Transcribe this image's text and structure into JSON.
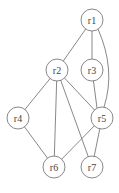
{
  "diagram": {
    "type": "graph",
    "nodes": [
      {
        "id": "r1",
        "label": "r1",
        "x": 92,
        "y": 20
      },
      {
        "id": "r2",
        "label": "r2",
        "x": 57,
        "y": 70
      },
      {
        "id": "r3",
        "label": "r3",
        "x": 92,
        "y": 70
      },
      {
        "id": "r4",
        "label": "r4",
        "x": 18,
        "y": 118
      },
      {
        "id": "r5",
        "label": "r5",
        "x": 102,
        "y": 118
      },
      {
        "id": "r6",
        "label": "r6",
        "x": 54,
        "y": 167
      },
      {
        "id": "r7",
        "label": "r7",
        "x": 92,
        "y": 167
      }
    ],
    "edges": [
      [
        "r1",
        "r2"
      ],
      [
        "r1",
        "r3"
      ],
      [
        "r1",
        "r5"
      ],
      [
        "r2",
        "r4"
      ],
      [
        "r2",
        "r6"
      ],
      [
        "r2",
        "r7"
      ],
      [
        "r2",
        "r5"
      ],
      [
        "r3",
        "r5"
      ],
      [
        "r4",
        "r6"
      ],
      [
        "r5",
        "r6"
      ],
      [
        "r5",
        "r7"
      ]
    ],
    "node_radius": 11,
    "caption": ""
  }
}
